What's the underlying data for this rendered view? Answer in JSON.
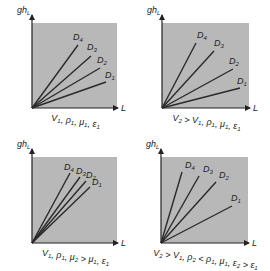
{
  "chart_data": [
    {
      "type": "line",
      "title": "",
      "xlabel": "L",
      "ylabel": "gh_L",
      "caption": "V1, ρ1, μ1, ε1",
      "caption_html": "V<tspan baseline-shift='sub' font-size='6'>1</tspan>, ρ<tspan baseline-shift='sub' font-size='6'>1</tspan>, μ<tspan baseline-shift='sub' font-size='6'>1</tspan>, ε<tspan baseline-shift='sub' font-size='6'>1</tspan>",
      "box": {
        "x": 32,
        "y": 23,
        "w": 85,
        "h": 85
      },
      "series": [
        {
          "name": "D4",
          "end": [
            78,
            45
          ],
          "label_pos": [
            73,
            40
          ]
        },
        {
          "name": "D3",
          "end": [
            91,
            56
          ],
          "label_pos": [
            87,
            50
          ]
        },
        {
          "name": "D2",
          "end": [
            100,
            68
          ],
          "label_pos": [
            97,
            63
          ]
        },
        {
          "name": "D1",
          "end": [
            106,
            82
          ],
          "label_pos": [
            105,
            78
          ]
        }
      ]
    },
    {
      "type": "line",
      "title": "",
      "xlabel": "L",
      "ylabel": "gh_L",
      "caption": "V2 > V1, ρ1, μ1, ε1",
      "box": {
        "x": 162,
        "y": 23,
        "w": 87,
        "h": 85
      },
      "series": [
        {
          "name": "D4",
          "end": [
            196,
            43
          ],
          "label_pos": [
            197,
            38
          ]
        },
        {
          "name": "D3",
          "end": [
            214,
            51
          ],
          "label_pos": [
            214,
            46
          ]
        },
        {
          "name": "D2",
          "end": [
            233,
            69
          ],
          "label_pos": [
            229,
            64
          ]
        },
        {
          "name": "D1",
          "end": [
            240,
            88
          ],
          "label_pos": [
            237,
            84
          ]
        }
      ]
    },
    {
      "type": "line",
      "title": "",
      "xlabel": "L",
      "ylabel": "gh_L",
      "caption": "V1, ρ1, μ2 > μ1, ε1",
      "box": {
        "x": 32,
        "y": 157,
        "w": 85,
        "h": 86
      },
      "series": [
        {
          "name": "D4",
          "end": [
            70,
            173
          ],
          "label_pos": [
            64,
            170
          ]
        },
        {
          "name": "D3",
          "end": [
            80,
            177
          ],
          "label_pos": [
            76,
            174
          ]
        },
        {
          "name": "D2",
          "end": [
            86,
            181
          ],
          "label_pos": [
            86,
            178
          ]
        },
        {
          "name": "D1",
          "end": [
            90,
            187
          ],
          "label_pos": [
            92,
            185
          ]
        }
      ]
    },
    {
      "type": "line",
      "title": "",
      "xlabel": "L",
      "ylabel": "gh_L",
      "caption": "V2 > V1, ρ2 < ρ1, μ1, ε2 > ε1",
      "box": {
        "x": 161,
        "y": 157,
        "w": 87,
        "h": 86
      },
      "series": [
        {
          "name": "D4",
          "end": [
            182,
            172
          ],
          "label_pos": [
            185,
            168
          ]
        },
        {
          "name": "D3",
          "end": [
            199,
            176
          ],
          "label_pos": [
            203,
            172
          ]
        },
        {
          "name": "D2",
          "end": [
            216,
            182
          ],
          "label_pos": [
            219,
            178
          ]
        },
        {
          "name": "D1",
          "end": [
            232,
            206
          ],
          "label_pos": [
            231,
            201
          ]
        }
      ]
    }
  ],
  "colors": {
    "panel_fill": "#b8b8b8",
    "line": "#2a2a2a",
    "text": "#222222"
  },
  "panels": [
    {
      "ylabel": "gh",
      "ylabel_sub": "L",
      "xlabel": "L",
      "caption_parts": [
        [
          "V",
          "1"
        ],
        [
          ", ρ",
          "1"
        ],
        [
          ", μ",
          "1"
        ],
        [
          ", ε",
          "1"
        ]
      ]
    },
    {
      "ylabel": "gh",
      "ylabel_sub": "L",
      "xlabel": "L",
      "caption_parts": [
        [
          "V",
          "2"
        ],
        [
          " > V",
          "1"
        ],
        [
          ", ρ",
          "1"
        ],
        [
          ", μ",
          "1"
        ],
        [
          ", ε",
          "1"
        ]
      ]
    },
    {
      "ylabel": "gh",
      "ylabel_sub": "L",
      "xlabel": "L",
      "caption_parts": [
        [
          "V",
          "1"
        ],
        [
          ", ρ",
          "1"
        ],
        [
          ", μ",
          "2"
        ],
        [
          " > μ",
          "1"
        ],
        [
          ", ε",
          "1"
        ]
      ]
    },
    {
      "ylabel": "gh",
      "ylabel_sub": "L",
      "xlabel": "L",
      "caption_parts": [
        [
          "V",
          "2"
        ],
        [
          " > V",
          "1"
        ],
        [
          ", ρ",
          "2"
        ],
        [
          " < ρ",
          "1"
        ],
        [
          ", μ",
          "1"
        ],
        [
          ", ε",
          "2"
        ],
        [
          " > ε",
          "1"
        ]
      ]
    }
  ]
}
